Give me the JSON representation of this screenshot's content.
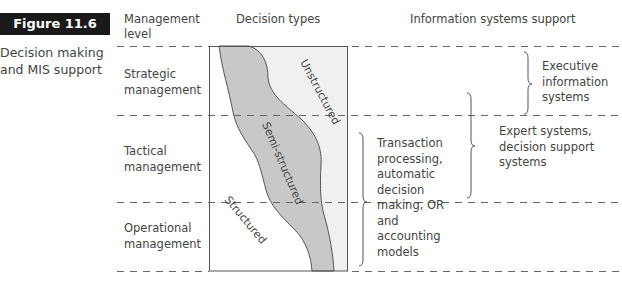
{
  "figure": {
    "label": "Figure 11.6",
    "caption": "Decision making and MIS support"
  },
  "columns": {
    "management_level": "Management level",
    "decision_types": "Decision types",
    "is_support": "Information systems support"
  },
  "levels": [
    {
      "label": "Strategic management"
    },
    {
      "label": "Tactical management"
    },
    {
      "label": "Operational management"
    }
  ],
  "decision_types": [
    {
      "label": "Unstructured",
      "fill": "#f0f0f0"
    },
    {
      "label": "Semi-structured",
      "fill": "#c8c8c8"
    },
    {
      "label": "Structured",
      "fill": "#ffffff"
    }
  ],
  "support_systems": [
    {
      "label": "Executive information systems",
      "span": "Strategic"
    },
    {
      "label": "Expert systems, decision support systems",
      "span": "Strategic-Tactical"
    },
    {
      "label": "Transaction processing, automatic decision making, OR and accounting models",
      "span": "Tactical-Operational"
    }
  ],
  "colors": {
    "line": "#555555",
    "dash": "#666666",
    "label_bg": "#1a1a1a",
    "label_fg": "#ffffff"
  }
}
